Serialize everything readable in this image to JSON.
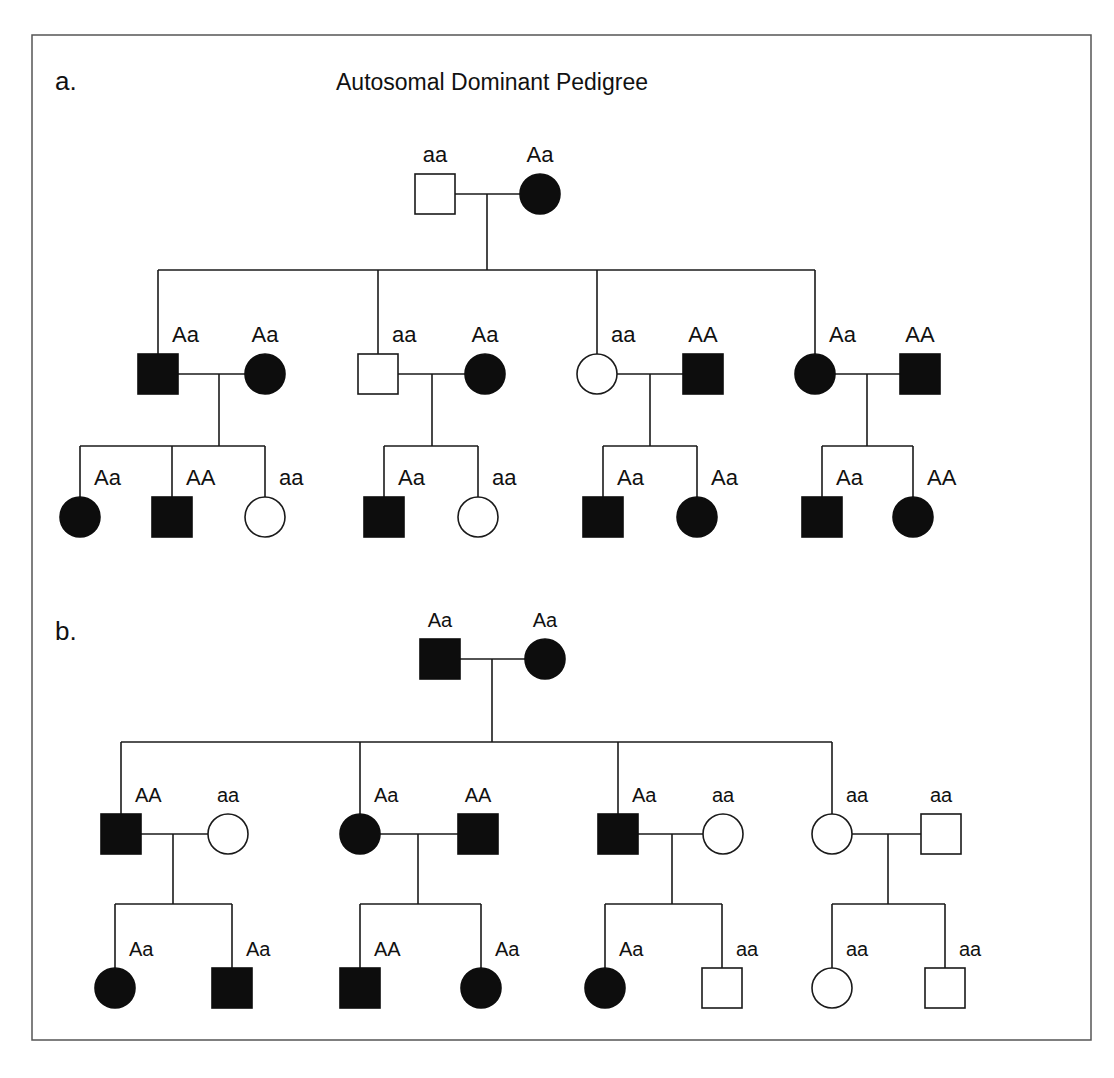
{
  "figure": {
    "width": 1114,
    "height": 1078,
    "frame": {
      "x": 32,
      "y": 35,
      "w": 1059,
      "h": 1005
    },
    "colors": {
      "affected": "#0d0d0d",
      "unaffected": "#ffffff",
      "line": "#1a1a1a",
      "frame": "#555555"
    }
  },
  "panels": [
    {
      "id": "a",
      "label": "a.",
      "label_pos": [
        55,
        90
      ],
      "title": "Autosomal Dominant Pedigree",
      "title_pos": [
        492,
        90
      ],
      "size": 40,
      "label_font": 22,
      "individuals": [
        {
          "id": "a-p1",
          "sex": "male",
          "affected": false,
          "genotype": "aa",
          "x": 435,
          "y": 194
        },
        {
          "id": "a-p2",
          "sex": "female",
          "affected": true,
          "genotype": "Aa",
          "x": 540,
          "y": 194
        },
        {
          "id": "a-c1",
          "sex": "male",
          "affected": true,
          "genotype": "Aa",
          "x": 158,
          "y": 374
        },
        {
          "id": "a-s1",
          "sex": "female",
          "affected": true,
          "genotype": "Aa",
          "x": 265,
          "y": 374
        },
        {
          "id": "a-c2",
          "sex": "male",
          "affected": false,
          "genotype": "aa",
          "x": 378,
          "y": 374
        },
        {
          "id": "a-s2",
          "sex": "female",
          "affected": true,
          "genotype": "Aa",
          "x": 485,
          "y": 374
        },
        {
          "id": "a-c3",
          "sex": "female",
          "affected": false,
          "genotype": "aa",
          "x": 597,
          "y": 374
        },
        {
          "id": "a-s3",
          "sex": "male",
          "affected": true,
          "genotype": "AA",
          "x": 703,
          "y": 374
        },
        {
          "id": "a-c4",
          "sex": "female",
          "affected": true,
          "genotype": "Aa",
          "x": 815,
          "y": 374
        },
        {
          "id": "a-s4",
          "sex": "male",
          "affected": true,
          "genotype": "AA",
          "x": 920,
          "y": 374
        },
        {
          "id": "a-g1",
          "sex": "female",
          "affected": true,
          "genotype": "Aa",
          "x": 80,
          "y": 517
        },
        {
          "id": "a-g2",
          "sex": "male",
          "affected": true,
          "genotype": "AA",
          "x": 172,
          "y": 517
        },
        {
          "id": "a-g3",
          "sex": "female",
          "affected": false,
          "genotype": "aa",
          "x": 265,
          "y": 517
        },
        {
          "id": "a-g4",
          "sex": "male",
          "affected": true,
          "genotype": "Aa",
          "x": 384,
          "y": 517
        },
        {
          "id": "a-g5",
          "sex": "female",
          "affected": false,
          "genotype": "aa",
          "x": 478,
          "y": 517
        },
        {
          "id": "a-g6",
          "sex": "male",
          "affected": true,
          "genotype": "Aa",
          "x": 603,
          "y": 517
        },
        {
          "id": "a-g7",
          "sex": "female",
          "affected": true,
          "genotype": "Aa",
          "x": 697,
          "y": 517
        },
        {
          "id": "a-g8",
          "sex": "male",
          "affected": true,
          "genotype": "Aa",
          "x": 822,
          "y": 517
        },
        {
          "id": "a-g9",
          "sex": "female",
          "affected": true,
          "genotype": "AA",
          "x": 913,
          "y": 517
        }
      ],
      "label_placement": {
        "a-p1": "above",
        "a-p2": "above",
        "a-c1": "right",
        "a-s1": "above",
        "a-c2": "right",
        "a-s2": "above",
        "a-c3": "right",
        "a-s3": "above",
        "a-c4": "right",
        "a-s4": "above",
        "a-g1": "right",
        "a-g2": "right",
        "a-g3": "right",
        "a-g4": "right",
        "a-g5": "right",
        "a-g6": "right",
        "a-g7": "right",
        "a-g8": "right",
        "a-g9": "right"
      },
      "unions": [
        {
          "a": "a-p1",
          "b": "a-p2",
          "drop_x": 487,
          "sib_y": 270,
          "children": [
            "a-c1",
            "a-c2",
            "a-c3",
            "a-c4"
          ]
        },
        {
          "a": "a-c1",
          "b": "a-s1",
          "drop_x": 219,
          "sib_y": 446,
          "children": [
            "a-g1",
            "a-g2",
            "a-g3"
          ]
        },
        {
          "a": "a-c2",
          "b": "a-s2",
          "drop_x": 432,
          "sib_y": 446,
          "children": [
            "a-g4",
            "a-g5"
          ]
        },
        {
          "a": "a-c3",
          "b": "a-s3",
          "drop_x": 650,
          "sib_y": 446,
          "children": [
            "a-g6",
            "a-g7"
          ]
        },
        {
          "a": "a-c4",
          "b": "a-s4",
          "drop_x": 867,
          "sib_y": 446,
          "children": [
            "a-g8",
            "a-g9"
          ]
        }
      ]
    },
    {
      "id": "b",
      "label": "b.",
      "label_pos": [
        55,
        640
      ],
      "title": "",
      "title_pos": [
        0,
        0
      ],
      "size": 40,
      "label_font": 20,
      "individuals": [
        {
          "id": "b-p1",
          "sex": "male",
          "affected": true,
          "genotype": "Aa",
          "x": 440,
          "y": 659
        },
        {
          "id": "b-p2",
          "sex": "female",
          "affected": true,
          "genotype": "Aa",
          "x": 545,
          "y": 659
        },
        {
          "id": "b-c1",
          "sex": "male",
          "affected": true,
          "genotype": "AA",
          "x": 121,
          "y": 834
        },
        {
          "id": "b-s1",
          "sex": "female",
          "affected": false,
          "genotype": "aa",
          "x": 228,
          "y": 834
        },
        {
          "id": "b-c2",
          "sex": "female",
          "affected": true,
          "genotype": "Aa",
          "x": 360,
          "y": 834
        },
        {
          "id": "b-s2",
          "sex": "male",
          "affected": true,
          "genotype": "AA",
          "x": 478,
          "y": 834
        },
        {
          "id": "b-c3",
          "sex": "male",
          "affected": true,
          "genotype": "Aa",
          "x": 618,
          "y": 834
        },
        {
          "id": "b-s3",
          "sex": "female",
          "affected": false,
          "genotype": "aa",
          "x": 723,
          "y": 834
        },
        {
          "id": "b-c4",
          "sex": "female",
          "affected": false,
          "genotype": "aa",
          "x": 832,
          "y": 834
        },
        {
          "id": "b-s4",
          "sex": "male",
          "affected": false,
          "genotype": "aa",
          "x": 941,
          "y": 834
        },
        {
          "id": "b-g1",
          "sex": "female",
          "affected": true,
          "genotype": "Aa",
          "x": 115,
          "y": 988
        },
        {
          "id": "b-g2",
          "sex": "male",
          "affected": true,
          "genotype": "Aa",
          "x": 232,
          "y": 988
        },
        {
          "id": "b-g3",
          "sex": "male",
          "affected": true,
          "genotype": "AA",
          "x": 360,
          "y": 988
        },
        {
          "id": "b-g4",
          "sex": "female",
          "affected": true,
          "genotype": "Aa",
          "x": 481,
          "y": 988
        },
        {
          "id": "b-g5",
          "sex": "female",
          "affected": true,
          "genotype": "Aa",
          "x": 605,
          "y": 988
        },
        {
          "id": "b-g6",
          "sex": "male",
          "affected": false,
          "genotype": "aa",
          "x": 722,
          "y": 988
        },
        {
          "id": "b-g7",
          "sex": "female",
          "affected": false,
          "genotype": "aa",
          "x": 832,
          "y": 988
        },
        {
          "id": "b-g8",
          "sex": "male",
          "affected": false,
          "genotype": "aa",
          "x": 945,
          "y": 988
        }
      ],
      "label_placement": {
        "b-p1": "above",
        "b-p2": "above",
        "b-c1": "right",
        "b-s1": "above",
        "b-c2": "right",
        "b-s2": "above",
        "b-c3": "right",
        "b-s3": "above",
        "b-c4": "right",
        "b-s4": "above",
        "b-g1": "right",
        "b-g2": "right",
        "b-g3": "right",
        "b-g4": "right",
        "b-g5": "right",
        "b-g6": "right",
        "b-g7": "right",
        "b-g8": "right"
      },
      "unions": [
        {
          "a": "b-p1",
          "b": "b-p2",
          "drop_x": 492,
          "sib_y": 742,
          "children": [
            "b-c1",
            "b-c2",
            "b-c3",
            "b-c4"
          ]
        },
        {
          "a": "b-c1",
          "b": "b-s1",
          "drop_x": 173,
          "sib_y": 904,
          "children": [
            "b-g1",
            "b-g2"
          ]
        },
        {
          "a": "b-c2",
          "b": "b-s2",
          "drop_x": 418,
          "sib_y": 904,
          "children": [
            "b-g3",
            "b-g4"
          ]
        },
        {
          "a": "b-c3",
          "b": "b-s3",
          "drop_x": 672,
          "sib_y": 904,
          "children": [
            "b-g5",
            "b-g6"
          ]
        },
        {
          "a": "b-c4",
          "b": "b-s4",
          "drop_x": 888,
          "sib_y": 904,
          "children": [
            "b-g7",
            "b-g8"
          ]
        }
      ]
    }
  ]
}
